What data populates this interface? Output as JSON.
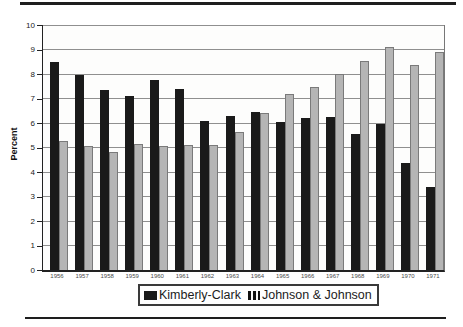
{
  "figure": {
    "type": "scanned-book-figure",
    "rules": {
      "top": true,
      "bottom": true,
      "color": "#1e1e1e"
    }
  },
  "chart_data": {
    "type": "bar",
    "title": "",
    "xlabel": "",
    "ylabel": "Percent",
    "ylim": [
      0,
      10
    ],
    "yticks": [
      0,
      1,
      2,
      3,
      4,
      5,
      6,
      7,
      8,
      9,
      10
    ],
    "grid": true,
    "legend_position": "bottom-center",
    "categories": [
      "1956",
      "1957",
      "1958",
      "1959",
      "1960",
      "1961",
      "1962",
      "1963",
      "1964",
      "1965",
      "1966",
      "1967",
      "1968",
      "1969",
      "1970",
      "1971"
    ],
    "series": [
      {
        "name": "Kimberly-Clark",
        "color": "#1a1a1a",
        "swatch_style": "solid-black",
        "values": [
          8.5,
          7.95,
          7.35,
          7.1,
          7.75,
          7.4,
          6.1,
          6.3,
          6.45,
          6.05,
          6.2,
          6.25,
          5.55,
          5.95,
          4.35,
          3.4
        ]
      },
      {
        "name": "Johnson & Johnson",
        "color": "#b5b5b5",
        "swatch_style": "black-vertical-stripes",
        "values": [
          5.25,
          5.05,
          4.8,
          5.15,
          5.05,
          5.1,
          5.1,
          5.65,
          6.4,
          7.2,
          7.45,
          8.0,
          8.55,
          9.1,
          8.35,
          8.9
        ]
      }
    ],
    "colors": {
      "gridline": "#8f8f8f",
      "axis": "#222222",
      "plot_background": "#fdfdfc"
    }
  }
}
